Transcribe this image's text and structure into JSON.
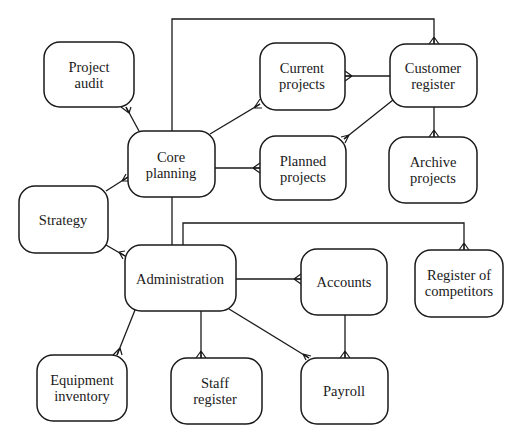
{
  "diagram": {
    "type": "entity-relationship (crow's foot)",
    "stroke_color": "#1a1a1a",
    "background": "#ffffff",
    "nodes": [
      {
        "id": "project_audit",
        "lines": [
          "Project",
          "audit"
        ],
        "x": 44,
        "y": 42,
        "w": 90,
        "h": 65
      },
      {
        "id": "core_planning",
        "lines": [
          "Core",
          "planning"
        ],
        "x": 128,
        "y": 131,
        "w": 87,
        "h": 66
      },
      {
        "id": "strategy",
        "lines": [
          "Strategy"
        ],
        "x": 19,
        "y": 186,
        "w": 89,
        "h": 67
      },
      {
        "id": "current_projects",
        "lines": [
          "Current",
          "projects"
        ],
        "x": 260,
        "y": 43,
        "w": 85,
        "h": 67
      },
      {
        "id": "customer_register",
        "lines": [
          "Customer",
          "register"
        ],
        "x": 390,
        "y": 44,
        "w": 87,
        "h": 63
      },
      {
        "id": "planned_projects",
        "lines": [
          "Planned",
          "projects"
        ],
        "x": 260,
        "y": 136,
        "w": 86,
        "h": 64
      },
      {
        "id": "archive_projects",
        "lines": [
          "Archive",
          "projects"
        ],
        "x": 389,
        "y": 137,
        "w": 88,
        "h": 66
      },
      {
        "id": "administration",
        "lines": [
          "Administration"
        ],
        "x": 125,
        "y": 245,
        "w": 111,
        "h": 66
      },
      {
        "id": "accounts",
        "lines": [
          "Accounts"
        ],
        "x": 301,
        "y": 249,
        "w": 86,
        "h": 66
      },
      {
        "id": "register_of_competitors",
        "lines": [
          "Register of",
          "competitors"
        ],
        "x": 415,
        "y": 250,
        "w": 88,
        "h": 67
      },
      {
        "id": "equipment_inventory",
        "lines": [
          "Equipment",
          "inventory"
        ],
        "x": 37,
        "y": 355,
        "w": 90,
        "h": 66
      },
      {
        "id": "staff_register",
        "lines": [
          "Staff",
          "register"
        ],
        "x": 171,
        "y": 358,
        "w": 91,
        "h": 66
      },
      {
        "id": "payroll",
        "lines": [
          "Payroll"
        ],
        "x": 301,
        "y": 358,
        "w": 87,
        "h": 66
      }
    ],
    "edges": [
      {
        "from": "core_planning",
        "to": "project_audit",
        "many_end": "project_audit"
      },
      {
        "from": "core_planning",
        "to": "current_projects",
        "many_end": "current_projects"
      },
      {
        "from": "core_planning",
        "to": "planned_projects",
        "many_end": "planned_projects"
      },
      {
        "from": "core_planning",
        "to": "strategy",
        "many_end": "core_planning"
      },
      {
        "from": "core_planning",
        "to": "customer_register",
        "many_end": "customer_register",
        "routing": "over-top"
      },
      {
        "from": "customer_register",
        "to": "current_projects",
        "many_end": "current_projects"
      },
      {
        "from": "customer_register",
        "to": "planned_projects",
        "many_end": "planned_projects"
      },
      {
        "from": "customer_register",
        "to": "archive_projects",
        "many_end": "archive_projects"
      },
      {
        "from": "core_planning",
        "to": "administration",
        "many_end": "none"
      },
      {
        "from": "strategy",
        "to": "administration",
        "many_end": "administration"
      },
      {
        "from": "administration",
        "to": "register_of_competitors",
        "many_end": "register_of_competitors",
        "routing": "over-top"
      },
      {
        "from": "administration",
        "to": "accounts",
        "many_end": "accounts"
      },
      {
        "from": "administration",
        "to": "equipment_inventory",
        "many_end": "equipment_inventory"
      },
      {
        "from": "administration",
        "to": "staff_register",
        "many_end": "staff_register"
      },
      {
        "from": "administration",
        "to": "payroll",
        "many_end": "payroll"
      },
      {
        "from": "accounts",
        "to": "payroll",
        "many_end": "payroll"
      }
    ]
  },
  "labels": {
    "project_audit": [
      "Project",
      "audit"
    ],
    "core_planning": [
      "Core",
      "planning"
    ],
    "strategy": [
      "Strategy"
    ],
    "current_projects": [
      "Current",
      "projects"
    ],
    "customer_register": [
      "Customer",
      "register"
    ],
    "planned_projects": [
      "Planned",
      "projects"
    ],
    "archive_projects": [
      "Archive",
      "projects"
    ],
    "administration": [
      "Administration"
    ],
    "accounts": [
      "Accounts"
    ],
    "register_of_competitors": [
      "Register of",
      "competitors"
    ],
    "equipment_inventory": [
      "Equipment",
      "inventory"
    ],
    "staff_register": [
      "Staff",
      "register"
    ],
    "payroll": [
      "Payroll"
    ]
  }
}
